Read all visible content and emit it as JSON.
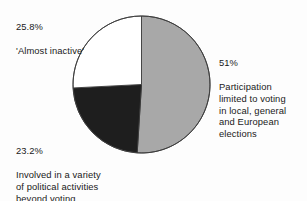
{
  "chart_data": {
    "type": "pie",
    "title": "",
    "subtitle": "",
    "xlabel": "",
    "ylabel": "",
    "legend_position": "callout-labels",
    "grid": false,
    "total": 100,
    "categories": [
      "Participation limited to voting in local, general and European elections",
      "Involved in a variety of political activities beyond voting",
      "'Almost inactive'"
    ],
    "values": [
      51,
      23.2,
      25.8
    ],
    "slices": [
      {
        "label": "51%",
        "value": 51,
        "description": "Participation\nlimited to voting\nin local, general\nand European\nelections",
        "color": "#a8a8a8",
        "start_angle": 0,
        "end_angle": 183.6
      },
      {
        "label": "23.2%",
        "value": 23.2,
        "description": "Involved in a variety\nof political activities\nbeyond voting",
        "color": "#1e1e1e",
        "start_angle": 183.6,
        "end_angle": 267.12
      },
      {
        "label": "25.8%",
        "value": 25.8,
        "description": "'Almost inactive'",
        "color": "#ffffff",
        "start_angle": 267.12,
        "end_angle": 360
      }
    ]
  },
  "labels": {
    "inactive": {
      "percent": "25.8%",
      "description": "'Almost inactive'"
    },
    "participation": {
      "percent": "51%",
      "description": "Participation\nlimited to voting\nin local, general\nand European\nelections"
    },
    "involved": {
      "percent": "23.2%",
      "description": "Involved in a variety\nof political activities\nbeyond voting"
    }
  },
  "style": {
    "background": "#fdfdfd",
    "text_color": "#1a1a1a",
    "outline_color": "#3b3b3b",
    "slice_gray": "#a8a8a8",
    "slice_dark": "#1e1e1e",
    "slice_white": "#ffffff"
  },
  "geometry": {
    "center_x": 141.5,
    "center_y": 84.5,
    "radius": 68.5
  }
}
